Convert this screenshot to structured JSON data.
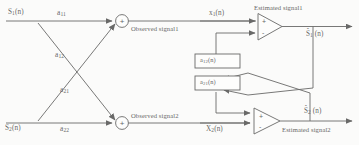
{
  "figure": {
    "width": 359,
    "height": 145,
    "line_color": "#2b2b2b",
    "text_color": "#232323",
    "background": "#fdfdfd"
  },
  "sources": [
    {
      "id": "s1",
      "label": "S₁(n)",
      "base": "S",
      "subscript": "1",
      "arg": "(n)"
    },
    {
      "id": "s2",
      "label": "S₂(n)",
      "base": "S",
      "subscript": "2",
      "arg": "(n)"
    }
  ],
  "mixing_coefficients": [
    {
      "id": "a11",
      "label": "a₁₁",
      "base": "a",
      "subscript": "11",
      "path": "S1 direct to sum1"
    },
    {
      "id": "a12",
      "label": "a12",
      "base": "a",
      "subscript": "12",
      "path": "S1 cross to sum2"
    },
    {
      "id": "a21",
      "label": "a21",
      "base": "a",
      "subscript": "21",
      "path": "S2 cross to sum1"
    },
    {
      "id": "a22",
      "label": "a22",
      "base": "a",
      "subscript": "22",
      "path": "S2 direct to sum2"
    }
  ],
  "summing_junctions": [
    {
      "id": "sum1",
      "sign": "+",
      "output_label": "Observed signal1"
    },
    {
      "id": "sum2",
      "sign": "+",
      "output_label": "Observed signal2"
    }
  ],
  "observed": [
    {
      "id": "obs1",
      "label": "Observed signal1"
    },
    {
      "id": "obs2",
      "label": "Observed signal2"
    }
  ],
  "mixed_signals": [
    {
      "id": "x1",
      "label": "x₁(n)",
      "base": "x",
      "subscript": "1",
      "arg": "(n)"
    },
    {
      "id": "x2",
      "label": "X₂(n)",
      "base": "X",
      "subscript": "2",
      "arg": "(n)"
    }
  ],
  "adaptive_filters": [
    {
      "id": "f12",
      "label": "a12(n)",
      "base": "a",
      "subscript": "12",
      "arg": "(n)"
    },
    {
      "id": "f21",
      "label": "a21(n)",
      "base": "a",
      "subscript": "21",
      "arg": "(n)"
    }
  ],
  "separators": [
    {
      "id": "amp1",
      "plus_sign": "+",
      "minus_sign": "-",
      "header": "Estimated signal1",
      "output_label": "Ŝ₁ (n)",
      "output_base": "S",
      "output_subscript": "1",
      "output_arg": "(n)"
    },
    {
      "id": "amp2",
      "plus_sign": "+",
      "minus_sign": "-",
      "header": "Estimated signal2",
      "output_label": "Ŝ₂ (n)",
      "output_base": "S",
      "output_subscript": "2",
      "output_arg": "(n)"
    }
  ],
  "estimated_headers": [
    {
      "id": "est1",
      "label": "Estimated signal1"
    },
    {
      "id": "est2",
      "label": "Estimated signal2"
    }
  ],
  "estimated_outputs": [
    {
      "id": "shat1",
      "base": "S",
      "subscript": "1",
      "arg": "(n)"
    },
    {
      "id": "shat2",
      "base": "S",
      "subscript": "2",
      "arg": "(n)"
    }
  ]
}
